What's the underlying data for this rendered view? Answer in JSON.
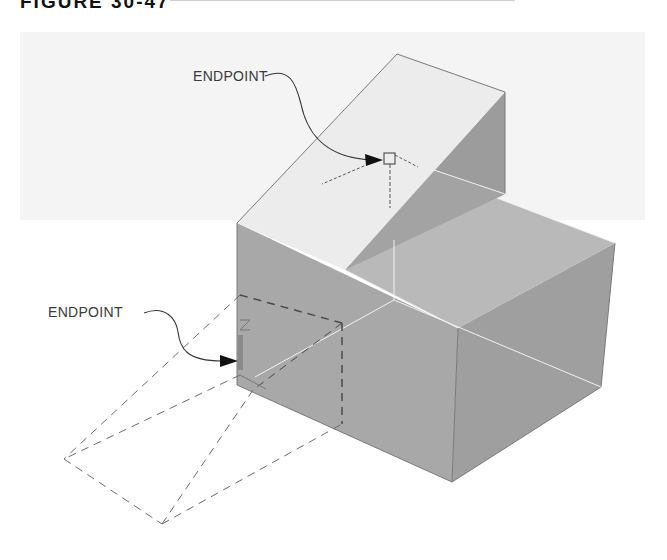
{
  "figure": {
    "caption_fragment": "FIGURE 30-47",
    "labels": {
      "top_endpoint": "ENDPOINT",
      "left_endpoint": "ENDPOINT"
    },
    "colors": {
      "background_band": "#f4f4f4",
      "top_slope_face": "#ececec",
      "wedge_side_face": "#9c9c9c",
      "front_left_face": "#a8a8a8",
      "front_right_face": "#9f9f9f",
      "right_top_face": "#b9b9b9",
      "inner_step_face": "#a3a3a3",
      "dashed_lines": "#6a6a6a",
      "leader_lines": "#333333"
    }
  }
}
